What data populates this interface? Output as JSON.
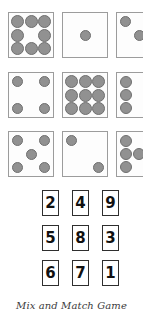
{
  "caption": "Mix and Match Game",
  "colors": {
    "background": "#ffffff",
    "die_face": "#fdfdfd",
    "die_border": "#9c9c9c",
    "pip_fill": "#919191",
    "pip_border": "#6f6f6f",
    "tile_border": "#2e2e2e",
    "tile_text": "#111111",
    "caption_text": "#3b3b3b"
  },
  "dice_grid": {
    "rows": 3,
    "columns": 3,
    "cells": [
      {
        "name": "die-eight",
        "dots": 8,
        "pattern": "3-2-3",
        "row": 1,
        "col": 1,
        "x": 8,
        "y": 12,
        "clipped": false
      },
      {
        "name": "die-one",
        "dots": 1,
        "pattern": "center",
        "row": 1,
        "col": 2,
        "x": 62,
        "y": 12,
        "clipped": false
      },
      {
        "name": "die-three",
        "dots": 3,
        "pattern": "diagonal",
        "row": 1,
        "col": 3,
        "x": 116,
        "y": 12,
        "clipped": true
      },
      {
        "name": "die-four",
        "dots": 4,
        "pattern": "corners",
        "row": 2,
        "col": 1,
        "x": 8,
        "y": 72,
        "clipped": false
      },
      {
        "name": "die-nine",
        "dots": 9,
        "pattern": "3-3-3",
        "row": 2,
        "col": 2,
        "x": 62,
        "y": 72,
        "clipped": false
      },
      {
        "name": "die-six",
        "dots": 6,
        "pattern": "3-3",
        "row": 2,
        "col": 3,
        "x": 116,
        "y": 72,
        "clipped": true
      },
      {
        "name": "die-five",
        "dots": 5,
        "pattern": "corners-center",
        "row": 3,
        "col": 1,
        "x": 8,
        "y": 131,
        "clipped": false
      },
      {
        "name": "die-two",
        "dots": 2,
        "pattern": "diagonal",
        "row": 3,
        "col": 2,
        "x": 62,
        "y": 131,
        "clipped": false
      },
      {
        "name": "die-seven",
        "dots": 7,
        "pattern": "3-1-3",
        "row": 3,
        "col": 3,
        "x": 116,
        "y": 131,
        "clipped": true
      }
    ]
  },
  "number_grid": {
    "rows": 3,
    "columns": 3,
    "tiles": [
      {
        "label": "2",
        "x": 42,
        "y": 4,
        "row": 1,
        "col": 1
      },
      {
        "label": "4",
        "x": 72,
        "y": 4,
        "row": 1,
        "col": 2
      },
      {
        "label": "9",
        "x": 102,
        "y": 4,
        "row": 1,
        "col": 3
      },
      {
        "label": "5",
        "x": 42,
        "y": 39,
        "row": 2,
        "col": 1
      },
      {
        "label": "8",
        "x": 72,
        "y": 39,
        "row": 2,
        "col": 2
      },
      {
        "label": "3",
        "x": 102,
        "y": 39,
        "row": 2,
        "col": 3
      },
      {
        "label": "6",
        "x": 42,
        "y": 74,
        "row": 3,
        "col": 1
      },
      {
        "label": "7",
        "x": 72,
        "y": 74,
        "row": 3,
        "col": 2
      },
      {
        "label": "1",
        "x": 102,
        "y": 74,
        "row": 3,
        "col": 3
      }
    ]
  }
}
